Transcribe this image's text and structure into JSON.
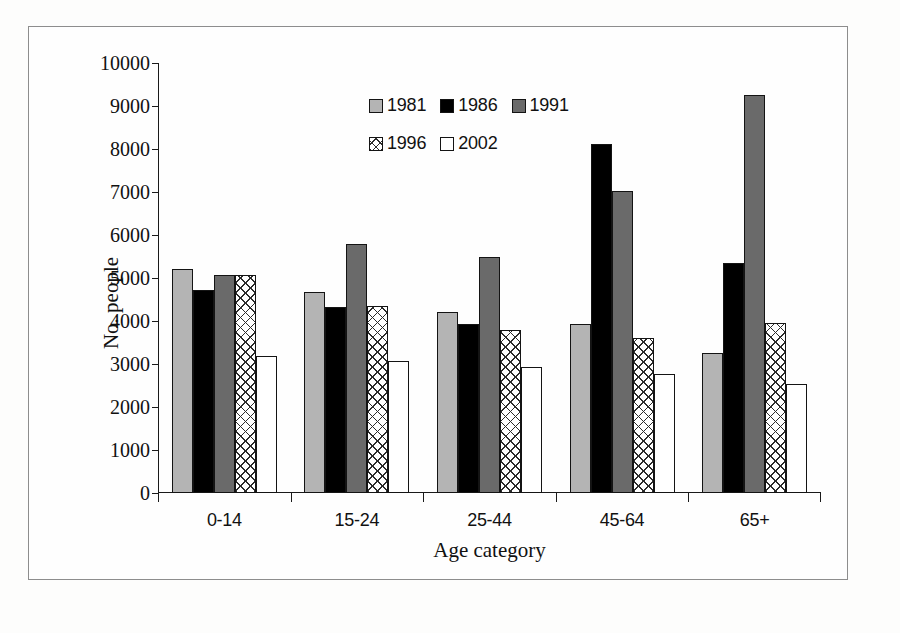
{
  "page": {
    "top_left_artifact": "",
    "top_right_artifact": ""
  },
  "chart_data": {
    "type": "bar",
    "title": "",
    "xlabel": "Age category",
    "ylabel": "No. people",
    "categories": [
      "0-14",
      "15-24",
      "25-44",
      "45-64",
      "65+"
    ],
    "series": [
      {
        "name": "1981",
        "color": "#b4b4b4",
        "pattern": "solid-light-gray",
        "values": [
          5210,
          4680,
          4220,
          3920,
          3250
        ]
      },
      {
        "name": "1986",
        "color": "#000000",
        "pattern": "solid-black",
        "values": [
          4720,
          4320,
          3920,
          8110,
          5340
        ]
      },
      {
        "name": "1991",
        "color": "#6a6a6a",
        "pattern": "solid-dark-gray",
        "values": [
          5080,
          5800,
          5490,
          7030,
          9250
        ]
      },
      {
        "name": "1996",
        "color": "#ffffff",
        "pattern": "cross-hatch",
        "values": [
          5070,
          4360,
          3780,
          3610,
          3960
        ]
      },
      {
        "name": "2002",
        "color": "#ffffff",
        "pattern": "empty-white",
        "values": [
          3190,
          3080,
          2920,
          2770,
          2540
        ]
      }
    ],
    "ylim": [
      0,
      10000
    ],
    "ytick_values": [
      0,
      1000,
      2000,
      3000,
      4000,
      5000,
      6000,
      7000,
      8000,
      9000,
      10000
    ],
    "ytick_labels": [
      "0",
      "1000",
      "2000",
      "3000",
      "4000",
      "5000",
      "6000",
      "7000",
      "8000",
      "9000",
      "10000"
    ],
    "grid": false,
    "legend_position": "top-center",
    "legend_rows": [
      [
        "1981",
        "1986",
        "1991"
      ],
      [
        "1996",
        "2002"
      ]
    ]
  }
}
